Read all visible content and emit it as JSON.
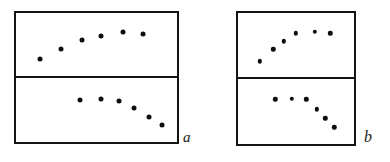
{
  "figure": {
    "title": "",
    "caption": "",
    "background_color": "#ffffff",
    "ink_color": "#141414",
    "dot_color": "#0d0d0d",
    "style": "hand-drawn line-art schematic"
  },
  "labels": {
    "panel_a": "a",
    "panel_b": "b"
  },
  "chart_data": {
    "type": "scatter",
    "title": "",
    "xlabel": "",
    "ylabel": "",
    "grid": false,
    "legend": "none",
    "xlim": [
      0,
      100
    ],
    "ylim": [
      0,
      100
    ],
    "panels": [
      {
        "group": "a",
        "group_label": "a",
        "position": "top-left",
        "subpanel": "top",
        "shape": "rising then plateau",
        "n_points": 6,
        "x": [
          12,
          26,
          40,
          53,
          68,
          81
        ],
        "y": [
          22,
          42,
          58,
          66,
          74,
          70
        ]
      },
      {
        "group": "a",
        "group_label": "a",
        "position": "bottom-left",
        "subpanel": "bottom",
        "shape": "plateau then descending",
        "n_points": 6,
        "x": [
          39,
          53,
          65,
          75,
          85,
          94
        ],
        "y": [
          68,
          70,
          66,
          54,
          38,
          22
        ]
      },
      {
        "group": "b",
        "group_label": "b",
        "position": "top-right",
        "subpanel": "top",
        "shape": "rising then plateau",
        "n_points": 6,
        "x": [
          15,
          28,
          38,
          50,
          68,
          83
        ],
        "y": [
          20,
          42,
          57,
          72,
          74,
          72
        ]
      },
      {
        "group": "b",
        "group_label": "b",
        "position": "bottom-right",
        "subpanel": "bottom",
        "shape": "plateau then steep descent",
        "n_points": 6,
        "x": [
          30,
          46,
          60,
          70,
          78,
          87
        ],
        "y": [
          72,
          73,
          72,
          54,
          38,
          22
        ]
      }
    ]
  }
}
